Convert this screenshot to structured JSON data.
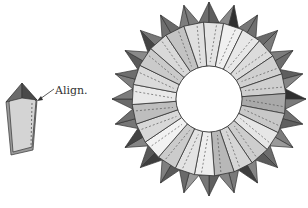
{
  "diagram": {
    "type": "origami-instruction",
    "unit": {
      "annotation_label": "Align.",
      "colors": {
        "tip": "#6b6b6b",
        "tip_dark": "#4a4a4a",
        "body": "#d4d4d4",
        "side": "#9a9a9a",
        "stroke": "#333333"
      }
    },
    "ring": {
      "center": [
        209,
        99
      ],
      "inner_radius": 33,
      "band_radius": 77,
      "point_radius": 97,
      "segments": 24,
      "band_shades": [
        "#e4e4e4",
        "#f0f0f0",
        "#e8e8e8",
        "#dcdcdc",
        "#d0d0d0",
        "#cfcfcf",
        "#a9a9a9",
        "#c8c8c8",
        "#e6e6e6",
        "#cdcdcd",
        "#d6d6d6",
        "#b8b8b8",
        "#eeeeee",
        "#e3e3e3",
        "#cbcbcb",
        "#f2f2f2",
        "#d8d8d8",
        "#bebebe",
        "#e9e9e9",
        "#dadada",
        "#cacaca",
        "#d9d9d9",
        "#c3c3c3",
        "#e0e0e0"
      ],
      "point_shades": [
        "#6e6e6e",
        "#8a8a8a",
        "#777777",
        "#6a6a6a",
        "#7d7d7d",
        "#5e5e5e",
        "#2f2f2f",
        "#707070",
        "#7b7b7b",
        "#6d6d6d",
        "#858585",
        "#7a7a7a",
        "#606060",
        "#9a9a9a",
        "#5a5a5a",
        "#3e3e3e",
        "#858585",
        "#777777",
        "#6a6a6a",
        "#7f7f7f",
        "#595959",
        "#444444",
        "#6f6f6f",
        "#7c7c7c"
      ],
      "stroke": "#333333"
    }
  }
}
